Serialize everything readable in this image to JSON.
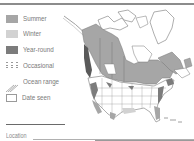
{
  "legend": {
    "items": [
      {
        "label": "Summer",
        "icon": "summer-swatch",
        "color": "#a6a6a6"
      },
      {
        "label": "Winter",
        "icon": "winter-swatch",
        "color": "#d2d2d2"
      },
      {
        "label": "Year-round",
        "icon": "year-round-swatch",
        "color": "#7c7c7c"
      },
      {
        "label": "Occasional",
        "icon": "dotted-lines-icon",
        "color": "#9a9a9a"
      },
      {
        "label": "Ocean range",
        "icon": "diagonal-lines-icon",
        "color": "#9a9a9a"
      },
      {
        "label": "Date seen",
        "icon": "checkbox-icon",
        "color": "#9a9a9a"
      }
    ]
  },
  "form": {
    "location_label": "Location"
  },
  "map": {
    "region": "North America",
    "summer_color": "#a6a6a6",
    "winter_color": "#d2d2d2",
    "year_round_color": "#7c7c7c",
    "border_color": "#6a6a6a"
  }
}
